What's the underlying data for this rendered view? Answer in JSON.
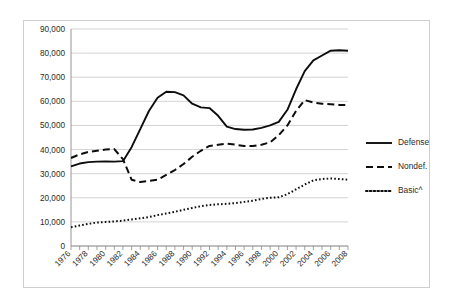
{
  "chart_data": {
    "type": "line",
    "title": "",
    "subtitle": "",
    "xlabel": "",
    "ylabel": "",
    "xlim": [
      1976,
      2008
    ],
    "ylim": [
      0,
      90000
    ],
    "grid": true,
    "legend_position": "right",
    "y_ticks": [
      0,
      10000,
      20000,
      30000,
      40000,
      50000,
      60000,
      70000,
      80000,
      90000
    ],
    "y_tick_labels": [
      "0",
      "10,000",
      "20,000",
      "30,000",
      "40,000",
      "50,000",
      "60,000",
      "70,000",
      "80,000",
      "90,000"
    ],
    "x_ticks": [
      1976,
      1977,
      1978,
      1979,
      1980,
      1981,
      1982,
      1983,
      1984,
      1985,
      1986,
      1987,
      1988,
      1989,
      1990,
      1991,
      1992,
      1993,
      1994,
      1995,
      1996,
      1997,
      1998,
      1999,
      2000,
      2001,
      2002,
      2003,
      2004,
      2005,
      2006,
      2007,
      2008
    ],
    "x_tick_labels": [
      "1976",
      "1978",
      "1980",
      "1982",
      "1984",
      "1986",
      "1988",
      "1990",
      "1992",
      "1994",
      "1996",
      "1998",
      "2000",
      "2002",
      "2004",
      "2006",
      "2008"
    ],
    "x_labeled_ticks": [
      1976,
      1978,
      1980,
      1982,
      1984,
      1986,
      1988,
      1990,
      1992,
      1994,
      1996,
      1998,
      2000,
      2002,
      2004,
      2006,
      2008
    ],
    "x": [
      1976,
      1977,
      1978,
      1979,
      1980,
      1981,
      1982,
      1983,
      1984,
      1985,
      1986,
      1987,
      1988,
      1989,
      1990,
      1991,
      1992,
      1993,
      1994,
      1995,
      1996,
      1997,
      1998,
      1999,
      2000,
      2001,
      2002,
      2003,
      2004,
      2005,
      2006,
      2007,
      2008
    ],
    "series": [
      {
        "name": "Defense",
        "style": "solid",
        "color": "#0d0d0d",
        "values": [
          33000,
          34200,
          34800,
          35000,
          35100,
          35000,
          35200,
          41000,
          48500,
          56000,
          61500,
          64000,
          63800,
          62500,
          59000,
          57500,
          57200,
          54000,
          49500,
          48500,
          48200,
          48300,
          49000,
          50000,
          51500,
          56500,
          65000,
          72500,
          77000,
          79000,
          81000,
          81200,
          81000
        ]
      },
      {
        "name": "Nondef.",
        "style": "dashed",
        "color": "#0d0d0d",
        "values": [
          36500,
          38000,
          39000,
          39500,
          40000,
          40200,
          36000,
          27500,
          26500,
          27000,
          27500,
          29500,
          31500,
          34000,
          37000,
          39500,
          41500,
          42000,
          42500,
          42000,
          41500,
          41500,
          42000,
          43000,
          46000,
          50000,
          56000,
          60500,
          59500,
          59000,
          58800,
          58500,
          58500
        ]
      },
      {
        "name": "Basic^",
        "style": "dotted",
        "color": "#0d0d0d",
        "values": [
          7800,
          8500,
          9200,
          9700,
          10000,
          10200,
          10500,
          11000,
          11500,
          12000,
          12800,
          13500,
          14200,
          15000,
          15800,
          16500,
          17000,
          17300,
          17500,
          17800,
          18300,
          18800,
          19500,
          20000,
          20200,
          21500,
          23500,
          25500,
          27200,
          27800,
          28000,
          27800,
          27500
        ]
      }
    ]
  },
  "legend": {
    "items": [
      {
        "label": "Defense",
        "style": "solid"
      },
      {
        "label": "Nondef.",
        "style": "dashed"
      },
      {
        "label": "Basic^",
        "style": "dotted"
      }
    ]
  }
}
